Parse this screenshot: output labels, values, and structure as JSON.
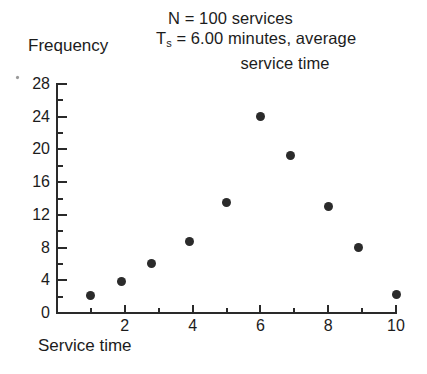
{
  "figure": {
    "caption_lines": [
      "N = 100 services",
      "= 6.00 minutes, average",
      "service time"
    ],
    "caption_symbol": "T",
    "caption_symbol_sub": "s",
    "y_axis_title": "Frequency",
    "x_axis_title": "Service time"
  },
  "chart_data": {
    "type": "scatter",
    "xlabel": "Service time",
    "ylabel": "Frequency",
    "xlim": [
      0,
      10
    ],
    "ylim": [
      0,
      28
    ],
    "grid": false,
    "legend": "none",
    "x_ticks_major": [
      2,
      4,
      6,
      8,
      10
    ],
    "x_ticks_minor": [
      1,
      3,
      5,
      7,
      9
    ],
    "x_tick_labels": [
      "2",
      "4",
      "6",
      "8",
      "10"
    ],
    "y_ticks_major": [
      0,
      4,
      8,
      12,
      16,
      20,
      24,
      28
    ],
    "y_ticks_minor": [
      2,
      6,
      10,
      14,
      18,
      22,
      26
    ],
    "y_tick_labels": [
      "0",
      "4",
      "8",
      "12",
      "16",
      "20",
      "24",
      "28"
    ],
    "marker": "filled-circle",
    "marker_color": "#2b2b2b",
    "points": [
      {
        "x": 1.0,
        "y": 2.2
      },
      {
        "x": 1.9,
        "y": 3.8
      },
      {
        "x": 2.8,
        "y": 6.0
      },
      {
        "x": 3.9,
        "y": 8.7
      },
      {
        "x": 5.0,
        "y": 13.5
      },
      {
        "x": 6.0,
        "y": 24.0
      },
      {
        "x": 6.9,
        "y": 19.3
      },
      {
        "x": 8.0,
        "y": 13.0
      },
      {
        "x": 8.9,
        "y": 8.0
      },
      {
        "x": 10.0,
        "y": 2.3
      }
    ],
    "annotations": [
      "N = 100 services",
      "Ts = 6.00 minutes, average service time"
    ]
  },
  "colors": {
    "background": "#ffffff",
    "axis": "#2a2a2a",
    "text": "#1c1c1c",
    "marker": "#2b2b2b"
  }
}
